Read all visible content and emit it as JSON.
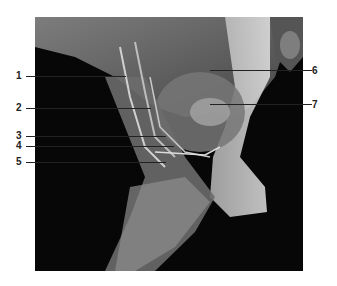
{
  "figure": {
    "labels_left": [
      {
        "number": "1",
        "y": 76
      },
      {
        "number": "2",
        "y": 108
      },
      {
        "number": "3",
        "y": 136
      },
      {
        "number": "4",
        "y": 146
      },
      {
        "number": "5",
        "y": 162
      }
    ],
    "labels_right": [
      {
        "number": "6",
        "y": 72
      },
      {
        "number": "7",
        "y": 106
      }
    ]
  }
}
